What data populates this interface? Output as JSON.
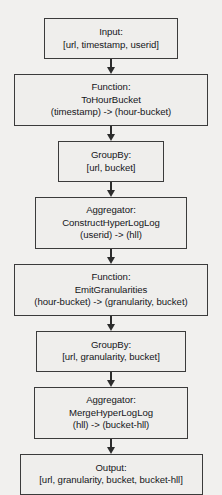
{
  "diagram": {
    "background_color": "#f1f0ee",
    "border_color": "#3b3b3b",
    "box_fill_color": "#efeeec",
    "text_color": "#15161a",
    "arrow_color": "#2c2c2c",
    "orientation": "top-to-bottom",
    "nodes": [
      {
        "id": "input",
        "kind": "Input",
        "width_px": 134,
        "height_px": 44,
        "lines": [
          "Input:",
          "[url, timestamp, userid]"
        ]
      },
      {
        "id": "to-hour-bucket",
        "kind": "Function",
        "width_px": 194,
        "height_px": 56,
        "lines": [
          "Function:",
          "ToHourBucket",
          "(timestamp) -> (hour-bucket)"
        ]
      },
      {
        "id": "group-by-url-bucket",
        "kind": "GroupBy",
        "width_px": 106,
        "height_px": 44,
        "lines": [
          "GroupBy:",
          "[url, bucket]"
        ]
      },
      {
        "id": "construct-hyperloglog",
        "kind": "Aggregator",
        "width_px": 152,
        "height_px": 56,
        "lines": [
          "Aggregator:",
          "ConstructHyperLogLog",
          "(userid) -> (hll)"
        ]
      },
      {
        "id": "emit-granularities",
        "kind": "Function",
        "width_px": 194,
        "height_px": 56,
        "lines": [
          "Function:",
          "EmitGranularities",
          "(hour-bucket) -> (granularity, bucket)"
        ]
      },
      {
        "id": "group-by-url-granularity-bucket",
        "kind": "GroupBy",
        "width_px": 150,
        "height_px": 44,
        "lines": [
          "GroupBy:",
          "[url, granularity, bucket]"
        ]
      },
      {
        "id": "merge-hyperloglog",
        "kind": "Aggregator",
        "width_px": 154,
        "height_px": 56,
        "lines": [
          "Aggregator:",
          "MergeHyperLogLog",
          "(hll) -> (bucket-hll)"
        ]
      },
      {
        "id": "output",
        "kind": "Output",
        "width_px": 183,
        "height_px": 44,
        "lines": [
          "Output:",
          "[url, granularity, bucket, bucket-hll]"
        ]
      }
    ],
    "connectors": [
      {
        "id": "arrow-input-to-tohourbucket",
        "from": "input",
        "to": "to-hour-bucket",
        "shape": "down-arrow",
        "stem_height_px": 8
      },
      {
        "id": "arrow-tohourbucket-to-groupby1",
        "from": "to-hour-bucket",
        "to": "group-by-url-bucket",
        "shape": "down-arrow",
        "stem_height_px": 8
      },
      {
        "id": "arrow-groupby1-to-construct",
        "from": "group-by-url-bucket",
        "to": "construct-hyperloglog",
        "shape": "down-arrow",
        "stem_height_px": 8
      },
      {
        "id": "arrow-construct-to-emit",
        "from": "construct-hyperloglog",
        "to": "emit-granularities",
        "shape": "down-arrow",
        "stem_height_px": 8
      },
      {
        "id": "arrow-emit-to-groupby2",
        "from": "emit-granularities",
        "to": "group-by-url-granularity-bucket",
        "shape": "down-arrow",
        "stem_height_px": 8
      },
      {
        "id": "arrow-groupby2-to-merge",
        "from": "group-by-url-granularity-bucket",
        "to": "merge-hyperloglog",
        "shape": "down-arrow",
        "stem_height_px": 8
      },
      {
        "id": "arrow-merge-to-output",
        "from": "merge-hyperloglog",
        "to": "output",
        "shape": "down-arrow",
        "stem_height_px": 8
      }
    ]
  }
}
